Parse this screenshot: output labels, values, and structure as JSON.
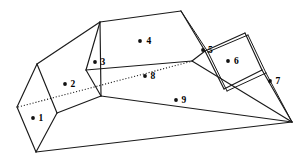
{
  "figure": {
    "background_color": "#ffffff",
    "line_color": "#1a1a1a",
    "label_color": "#000000",
    "width": 306,
    "height": 160,
    "face_labels": [
      {
        "id": "1",
        "text": "1",
        "dot_x": 33,
        "dot_y": 118,
        "text_x": 38.5,
        "text_y": 118.5
      },
      {
        "id": "2",
        "text": "2",
        "dot_x": 65,
        "dot_y": 84,
        "text_x": 70.5,
        "text_y": 84.5
      },
      {
        "id": "3",
        "text": "3",
        "dot_x": 95,
        "dot_y": 62,
        "text_x": 100.5,
        "text_y": 62.5
      },
      {
        "id": "4",
        "text": "4",
        "dot_x": 140,
        "dot_y": 41,
        "text_x": 146.5,
        "text_y": 41.5
      },
      {
        "id": "5",
        "text": "5",
        "dot_x": 203,
        "dot_y": 50,
        "text_x": 208.0,
        "text_y": 50.5
      },
      {
        "id": "6",
        "text": "6",
        "dot_x": 228,
        "dot_y": 61,
        "text_x": 234.0,
        "text_y": 61.5
      },
      {
        "id": "7",
        "text": "7",
        "dot_x": 270,
        "dot_y": 81,
        "text_x": 275.5,
        "text_y": 81.5
      },
      {
        "id": "8",
        "text": "8",
        "dot_x": 145,
        "dot_y": 76,
        "text_x": 150.5,
        "text_y": 76.5
      },
      {
        "id": "9",
        "text": "9",
        "dot_x": 176,
        "dot_y": 100,
        "text_x": 181.5,
        "text_y": 100.5
      }
    ],
    "geometry": {
      "solid_edges": [
        "M 37 64 L 17 107",
        "M 17 107 L 36 152",
        "M 36 152 L 57 113",
        "M 57 113 L 37 64",
        "M 37 64 L 100 22",
        "M 57 113 L 101 96",
        "M 36 152 L 292 122",
        "M 100 22 L 86 70",
        "M 86 70 L 101 96",
        "M 101 96 L 100 22",
        "M 100 22 L 181 11",
        "M 86 70 L 192 61",
        "M 101 96 L 292 122",
        "M 181 11 L 205 51",
        "M 181 11 L 208 52",
        "M 192 61 L 205 51",
        "M 205 51 L 245 33",
        "M 208 52 L 248 35",
        "M 245 33 L 262 70",
        "M 248 35 L 266 73",
        "M 205 51 L 224 89",
        "M 208 52 L 227 91",
        "M 224 89 L 262 70",
        "M 227 91 L 266 73",
        "M 262 70 L 292 122",
        "M 266 73 L 292 122",
        "M 192 61 L 292 122"
      ],
      "hidden_edges": [
        "M 18 107 L 193 61"
      ]
    }
  }
}
